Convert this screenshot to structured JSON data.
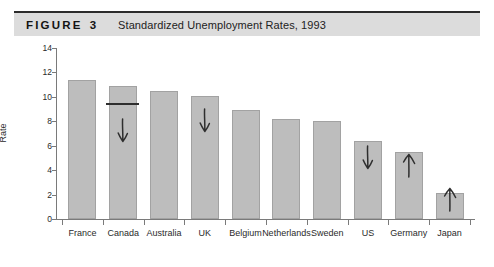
{
  "figure": {
    "label": "FIGURE",
    "number": "3",
    "title": "Standardized Unemployment Rates, 1993"
  },
  "chart_data": {
    "type": "bar",
    "title": "Standardized Unemployment Rates, 1993",
    "xlabel": "",
    "ylabel": "Rate",
    "ylim": [
      0,
      14
    ],
    "yticks": [
      0,
      2,
      4,
      6,
      8,
      10,
      12,
      14
    ],
    "grid": false,
    "legend": null,
    "categories": [
      "France",
      "Canada",
      "Australia",
      "UK",
      "Belgium",
      "Netherlands",
      "Sweden",
      "US",
      "Germany",
      "Japan"
    ],
    "values": [
      11.4,
      10.9,
      10.5,
      10.1,
      8.9,
      8.2,
      8.0,
      6.4,
      5.5,
      2.1
    ],
    "annotations": [
      {
        "category": "Canada",
        "type": "horizontal-line",
        "value": 9.5
      },
      {
        "category": "Canada",
        "type": "arrow-down"
      },
      {
        "category": "UK",
        "type": "arrow-down"
      },
      {
        "category": "US",
        "type": "arrow-down"
      },
      {
        "category": "Germany",
        "type": "arrow-up"
      },
      {
        "category": "Japan",
        "type": "arrow-up"
      }
    ],
    "colors": {
      "bar_fill": "#bdbdbd",
      "bar_stroke": "#a2a2a2",
      "axis": "#7a7a7a",
      "annotation": "#2e2e2e",
      "header_band": "#dcdcdc"
    }
  },
  "ytick_labels": [
    "0",
    "2",
    "4",
    "6",
    "8",
    "10",
    "12",
    "14"
  ]
}
